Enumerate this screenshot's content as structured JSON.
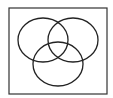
{
  "diagram": {
    "type": "venn",
    "sets": 3,
    "frame": {
      "x": 9,
      "y": 8,
      "width": 98,
      "height": 86,
      "stroke": "#333333"
    },
    "circles": [
      {
        "name": "left",
        "cx": 43,
        "cy": 40,
        "rx": 25,
        "ry": 22
      },
      {
        "name": "right",
        "cx": 73,
        "cy": 40,
        "rx": 25,
        "ry": 22
      },
      {
        "name": "bottom",
        "cx": 58,
        "cy": 64,
        "rx": 25,
        "ry": 22
      }
    ],
    "stroke_color": "#222222",
    "background": "#ffffff"
  }
}
